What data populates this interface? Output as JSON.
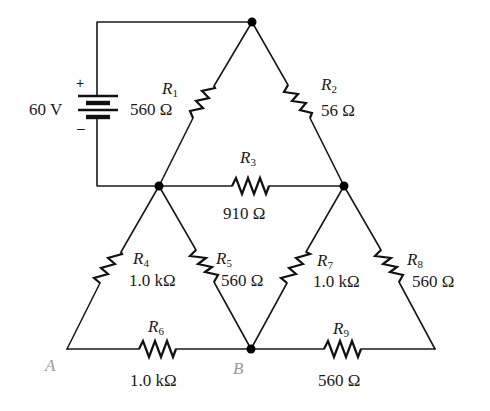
{
  "diagram": {
    "type": "circuit-schematic",
    "source": {
      "label": "60 V",
      "plus": "+",
      "minus": "–"
    },
    "resistors": [
      {
        "id": "R1",
        "name": "R",
        "sub": "1",
        "value": "560 Ω"
      },
      {
        "id": "R2",
        "name": "R",
        "sub": "2",
        "value": "56 Ω"
      },
      {
        "id": "R3",
        "name": "R",
        "sub": "3",
        "value": "910 Ω"
      },
      {
        "id": "R4",
        "name": "R",
        "sub": "4",
        "value": "1.0 kΩ"
      },
      {
        "id": "R5",
        "name": "R",
        "sub": "5",
        "value": "560 Ω"
      },
      {
        "id": "R6",
        "name": "R",
        "sub": "6",
        "value": "1.0 kΩ"
      },
      {
        "id": "R7",
        "name": "R",
        "sub": "7",
        "value": "1.0 kΩ"
      },
      {
        "id": "R8",
        "name": "R",
        "sub": "8",
        "value": "560 Ω"
      },
      {
        "id": "R9",
        "name": "R",
        "sub": "9",
        "value": "560 Ω"
      }
    ],
    "points": {
      "a": "A",
      "b": "B"
    },
    "colors": {
      "wire": "#1a1a1a",
      "point_label": "#9a9a9a",
      "background": "#ffffff"
    }
  }
}
